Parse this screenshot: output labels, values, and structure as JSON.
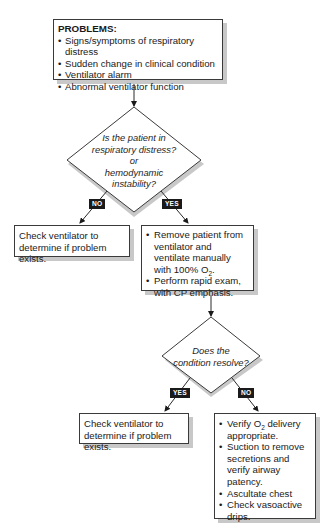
{
  "problems": {
    "title": "PROBLEMS:",
    "items": [
      "Signs/symptoms of respiratory distress",
      "Sudden change in clinical condition",
      "Ventilator alarm",
      "Abnormal ventilator function"
    ]
  },
  "decision1": {
    "lines": [
      "Is the patient in",
      "respiratory distress?",
      "or",
      "hemodynamic",
      "instability?"
    ],
    "no_label": "NO",
    "yes_label": "YES"
  },
  "no_branch1": {
    "line1": "Check ventilator to",
    "line2": "determine if problem exists."
  },
  "yes_branch1": {
    "item1_a": "Remove patient from ventilator and ventilate manually with 100% O",
    "item1_sub": "2",
    "item1_b": ".",
    "item2": "Perform rapid exam, with CP emphasis."
  },
  "decision2": {
    "lines": [
      "Does the",
      "condition resolve?"
    ],
    "yes_label": "YES",
    "no_label": "NO"
  },
  "yes_branch2": {
    "line1": "Check ventilator to",
    "line2": "determine if problem exists."
  },
  "no_branch2": {
    "item1_a": "Verify O",
    "item1_sub": "2",
    "item1_b": " delivery appropriate.",
    "item2": "Suction to remove secretions and verify airway patency.",
    "item3": "Ascultate chest",
    "item4": "Check vasoactive drips."
  },
  "colors": {
    "line": "#2a2a2a",
    "shadow": "#c8c8c8",
    "tag_bg": "#1a1a1a",
    "tag_text": "#ffffff"
  }
}
